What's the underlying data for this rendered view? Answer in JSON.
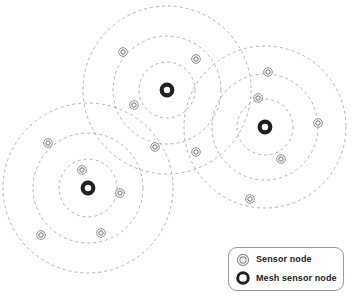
{
  "figure": {
    "width": 352,
    "height": 308,
    "background_color": "#ffffff"
  },
  "style": {
    "ring_color": "#9e9e9e",
    "ring_dash": "3 3",
    "ring_width": 0.8,
    "sensor_outer_color": "#8c8c8c",
    "sensor_inner_color": "#6e6e6e",
    "sensor_fill": "#ffffff",
    "mesh_ring_color": "#202020",
    "mesh_fill": "#ffffff",
    "legend_border_color": "#9a9a9a",
    "legend_text_color": "#1c1c1c"
  },
  "clusters": [
    {
      "id": "cluster-top",
      "name": "top-middle-cluster",
      "center": {
        "x": 167,
        "y": 90
      },
      "ring_radii": [
        28,
        54,
        84
      ],
      "mesh_node": {
        "x": 167,
        "y": 90,
        "label": "Mesh sensor node"
      },
      "sensor_nodes": [
        {
          "x": 123,
          "y": 52,
          "label": "Sensor node"
        },
        {
          "x": 196,
          "y": 59,
          "label": "Sensor node"
        },
        {
          "x": 134,
          "y": 105,
          "label": "Sensor node"
        },
        {
          "x": 155,
          "y": 147,
          "label": "Sensor node"
        }
      ]
    },
    {
      "id": "cluster-right",
      "name": "right-cluster",
      "center": {
        "x": 265,
        "y": 127
      },
      "ring_radii": [
        28,
        53,
        81
      ],
      "mesh_node": {
        "x": 265,
        "y": 127,
        "label": "Mesh sensor node"
      },
      "sensor_nodes": [
        {
          "x": 268,
          "y": 72,
          "label": "Sensor node"
        },
        {
          "x": 258,
          "y": 98,
          "label": "Sensor node"
        },
        {
          "x": 318,
          "y": 123,
          "label": "Sensor node"
        },
        {
          "x": 281,
          "y": 159,
          "label": "Sensor node"
        },
        {
          "x": 250,
          "y": 199,
          "label": "Sensor node"
        },
        {
          "x": 196,
          "y": 152,
          "label": "Sensor node"
        }
      ]
    },
    {
      "id": "cluster-left",
      "name": "bottom-left-cluster",
      "center": {
        "x": 88,
        "y": 188
      },
      "ring_radii": [
        29,
        55,
        85
      ],
      "mesh_node": {
        "x": 88,
        "y": 188,
        "label": "Mesh sensor node"
      },
      "sensor_nodes": [
        {
          "x": 48,
          "y": 143,
          "label": "Sensor node"
        },
        {
          "x": 82,
          "y": 170,
          "label": "Sensor node"
        },
        {
          "x": 120,
          "y": 193,
          "label": "Sensor node"
        },
        {
          "x": 41,
          "y": 235,
          "label": "Sensor node"
        },
        {
          "x": 101,
          "y": 233,
          "label": "Sensor node"
        }
      ]
    }
  ],
  "legend": {
    "items": [
      {
        "icon": "sensor-node-icon",
        "label": "Sensor node"
      },
      {
        "icon": "mesh-sensor-node-icon",
        "label": "Mesh sensor node"
      }
    ]
  }
}
